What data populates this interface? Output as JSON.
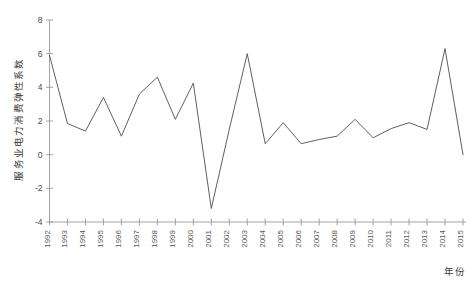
{
  "figure": {
    "top_partial_text": "",
    "background_color": "#ffffff",
    "line_color": "#4d4d4d",
    "axis_color": "#9a9a9a"
  },
  "axis": {
    "ylabel": "服务业电力消费弹性系数",
    "xlabel": "年份",
    "yticks": [
      "8",
      "6",
      "4",
      "2",
      "0",
      "-2",
      "-4"
    ],
    "xticks": [
      "1992",
      "1993",
      "1994",
      "1995",
      "1996",
      "1997",
      "1998",
      "1999",
      "2000",
      "2001",
      "2002",
      "2003",
      "2004",
      "2005",
      "2006",
      "2007",
      "2008",
      "2009",
      "2010",
      "2011",
      "2012",
      "2013",
      "2014",
      "2015"
    ]
  },
  "chart_data": {
    "type": "line",
    "title": "",
    "xlabel": "年份",
    "ylabel": "服务业电力消费弹性系数",
    "x": [
      1992,
      1993,
      1994,
      1995,
      1996,
      1997,
      1998,
      1999,
      2000,
      2001,
      2002,
      2003,
      2004,
      2005,
      2006,
      2007,
      2008,
      2009,
      2010,
      2011,
      2012,
      2013,
      2014,
      2015
    ],
    "categories": [
      "1992",
      "1993",
      "1994",
      "1995",
      "1996",
      "1997",
      "1998",
      "1999",
      "2000",
      "2001",
      "2002",
      "2003",
      "2004",
      "2005",
      "2006",
      "2007",
      "2008",
      "2009",
      "2010",
      "2011",
      "2012",
      "2013",
      "2014",
      "2015"
    ],
    "values": [
      5.9,
      1.85,
      1.4,
      3.4,
      1.1,
      3.6,
      4.6,
      2.1,
      4.25,
      -3.2,
      1.5,
      6.0,
      0.65,
      1.9,
      0.65,
      0.9,
      1.1,
      2.1,
      1.0,
      1.55,
      1.9,
      1.5,
      6.3,
      0.0
    ],
    "series": [
      {
        "name": "服务业电力消费弹性系数",
        "values": [
          5.9,
          1.85,
          1.4,
          3.4,
          1.1,
          3.6,
          4.6,
          2.1,
          4.25,
          -3.2,
          1.5,
          6.0,
          0.65,
          1.9,
          0.65,
          0.9,
          1.1,
          2.1,
          1.0,
          1.55,
          1.9,
          1.5,
          6.3,
          0.0
        ]
      }
    ],
    "ylim": [
      -4,
      8
    ],
    "yticks": [
      8,
      6,
      4,
      2,
      0,
      -2,
      -4
    ],
    "grid": false,
    "legend": "none",
    "markers": false
  }
}
